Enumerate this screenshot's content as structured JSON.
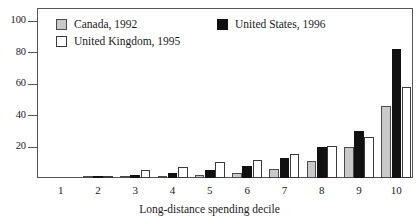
{
  "chart_data": {
    "type": "bar",
    "title": "",
    "subtitle": "",
    "xlabel": "Long-distance spending decile",
    "ylabel": "",
    "categories": [
      "1",
      "2",
      "3",
      "4",
      "5",
      "6",
      "7",
      "8",
      "9",
      "10"
    ],
    "series": [
      {
        "name": "Canada, 1992",
        "color": "#c9c9c9",
        "values": [
          0,
          0.8,
          1.5,
          1.2,
          2.0,
          3.5,
          5.5,
          11.0,
          20.0,
          46.0
        ]
      },
      {
        "name": "United States, 1996",
        "color": "#111111",
        "values": [
          0,
          0.3,
          2.0,
          3.0,
          5.0,
          7.5,
          12.5,
          19.5,
          30.0,
          82.0
        ]
      },
      {
        "name": "United Kingdom, 1995",
        "color": "#ffffff",
        "values": [
          0,
          0.2,
          5.0,
          7.0,
          10.0,
          11.5,
          15.5,
          20.2,
          26.0,
          58.0
        ]
      }
    ],
    "series_draw_order": [
      "Canada, 1992",
      "United States, 1996",
      "United Kingdom, 1995"
    ],
    "yticks": [
      20,
      40,
      60,
      80,
      100
    ],
    "ylim": [
      0,
      108
    ],
    "grid": false,
    "legend_position": "top-left-inside"
  },
  "legend": {
    "items": [
      {
        "label": "Canada, 1992",
        "swatch": "canada"
      },
      {
        "label": "United Kingdom, 1995",
        "swatch": "uk"
      },
      {
        "label": "United States, 1996",
        "swatch": "us"
      }
    ]
  }
}
